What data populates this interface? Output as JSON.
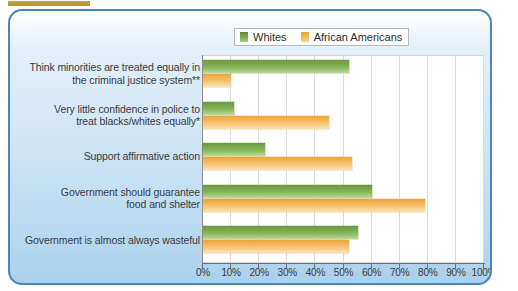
{
  "panel": {
    "copyright": "© Cengage Learning"
  },
  "legend": {
    "items": [
      {
        "label": "Whites",
        "color": "#7cab4e",
        "swatch": "green-swatch"
      },
      {
        "label": "African Americans",
        "color": "#f3b75c",
        "swatch": "orange-swatch"
      }
    ]
  },
  "chart_data": {
    "type": "bar",
    "orientation": "horizontal",
    "title": "",
    "xlabel": "",
    "ylabel": "",
    "xlim": [
      0,
      100
    ],
    "xtick_labels": [
      "0%",
      "10%",
      "20%",
      "30%",
      "40%",
      "50%",
      "60%",
      "70%",
      "80%",
      "90%",
      "100%"
    ],
    "xticks": [
      0,
      10,
      20,
      30,
      40,
      50,
      60,
      70,
      80,
      90,
      100
    ],
    "grid": true,
    "legend_position": "top-right",
    "categories": [
      "Think minorities are treated equally in the criminal justice system**",
      "Very little confidence in police to treat blacks/whites equally*",
      "Support affirmative action",
      "Government should guarantee food and shelter",
      "Government is almost always wasteful"
    ],
    "category_lines": [
      [
        "Think minorities are treated equally in",
        "the criminal justice system**"
      ],
      [
        "Very little confidence in police to",
        "treat blacks/whites equally*"
      ],
      [
        "Support affirmative action"
      ],
      [
        "Government should guarantee",
        "food and shelter"
      ],
      [
        "Government is almost always wasteful"
      ]
    ],
    "series": [
      {
        "name": "Whites",
        "color": "#7cab4e",
        "values": [
          52,
          11,
          22,
          60,
          55
        ]
      },
      {
        "name": "African Americans",
        "color": "#f3b75c",
        "values": [
          10,
          45,
          53,
          79,
          52
        ]
      }
    ]
  }
}
